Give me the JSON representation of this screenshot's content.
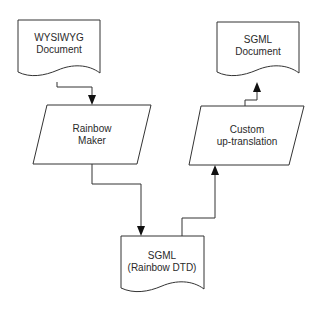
{
  "diagram": {
    "type": "flowchart",
    "nodes": [
      {
        "id": "wysiwyg",
        "shape": "document",
        "line1": "WYSIWYG",
        "line2": "Document"
      },
      {
        "id": "rainbow_maker",
        "shape": "parallelogram",
        "line1": "Rainbow",
        "line2": "Maker"
      },
      {
        "id": "sgml_rainbow",
        "shape": "document",
        "line1": "SGML",
        "line2": "(Rainbow DTD)"
      },
      {
        "id": "custom_up",
        "shape": "parallelogram",
        "line1": "Custom",
        "line2": "up-translation"
      },
      {
        "id": "sgml_doc",
        "shape": "document",
        "line1": "SGML",
        "line2": "Document"
      }
    ],
    "edges": [
      {
        "from": "wysiwyg",
        "to": "rainbow_maker"
      },
      {
        "from": "rainbow_maker",
        "to": "sgml_rainbow"
      },
      {
        "from": "sgml_rainbow",
        "to": "custom_up"
      },
      {
        "from": "custom_up",
        "to": "sgml_doc"
      }
    ],
    "colors": {
      "stroke": "#333333",
      "text": "#2a2a2a",
      "background": "#ffffff"
    }
  }
}
